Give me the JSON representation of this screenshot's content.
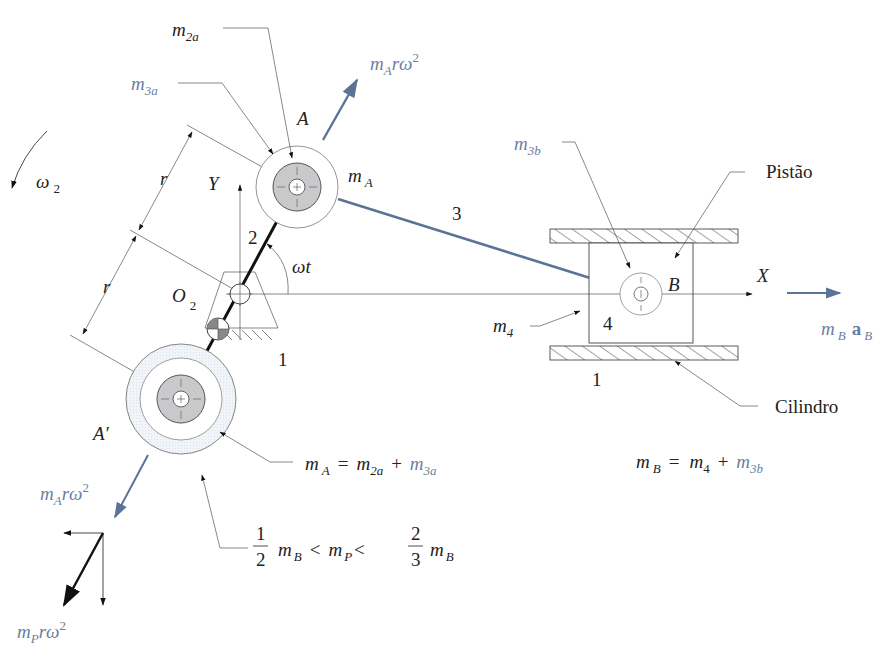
{
  "figure": {
    "colors": {
      "ink": "#222222",
      "blue": "#5b7396",
      "blue_text": "#6a7f9e",
      "mass_fill": "#c9c9cb",
      "ring_fill": "#eef1f6"
    },
    "labels": {
      "omega2": "ω",
      "omega2_sub": "2",
      "r_upper": "r",
      "r_lower": "r",
      "y_axis": "Y",
      "x_axis": "X",
      "o2": "O",
      "o2_sub": "2",
      "link2": "2",
      "link3": "3",
      "link4": "4",
      "ground_left": "1",
      "ground_right": "1",
      "omega_t": "ωt",
      "point_a": "A",
      "point_a_prime": "A′",
      "point_b": "B",
      "m2a": "m",
      "m2a_sub": "2a",
      "m3a": "m",
      "m3a_sub": "3a",
      "mA": "m",
      "mA_sub": "A",
      "m3b": "m",
      "m3b_sub": "3b",
      "m4": "m",
      "m4_sub": "4",
      "piston": "Pistão",
      "cylinder": "Cilindro"
    },
    "forces": {
      "top_force": {
        "m": "m",
        "sub": "A",
        "rest": "rω",
        "sup": "2"
      },
      "bottom_force": {
        "m": "m",
        "sub": "A",
        "rest": "rω",
        "sup": "2"
      },
      "counter_force": {
        "m": "m",
        "sub": "P",
        "rest": "rω",
        "sup": "2"
      },
      "piston_force": {
        "m": "m",
        "sub": "B",
        "a": "a",
        "a_sub": "B"
      }
    },
    "equations": {
      "mA_eq": {
        "lhs": "m",
        "lhs_sub": "A",
        "eq": "=",
        "t1": "m",
        "t1_sub": "2a",
        "plus": "+",
        "t2": "m",
        "t2_sub": "3a"
      },
      "mB_eq": {
        "lhs": "m",
        "lhs_sub": "B",
        "eq": "=",
        "t1": "m",
        "t1_sub": "4",
        "plus": "+",
        "t2": "m",
        "t2_sub": "3b"
      },
      "mP_ineq": {
        "f1_num": "1",
        "f1_den": "2",
        "m1": "m",
        "m1_sub": "B",
        "lt1": "<",
        "mp": "m",
        "mp_sub": "P",
        "lt2": "<",
        "f2_num": "2",
        "f2_den": "3",
        "m2": "m",
        "m2_sub": "B"
      }
    }
  }
}
